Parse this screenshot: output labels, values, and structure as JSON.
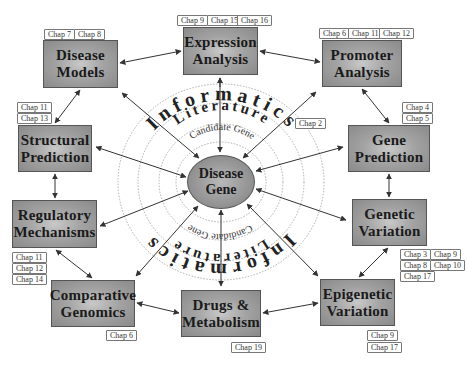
{
  "center": {
    "line1": "Disease",
    "line2": "Gene"
  },
  "rings": {
    "inner": "Candidate Gene",
    "middle": "Literature",
    "outer": "Informatics"
  },
  "nodes": [
    {
      "id": "disease-models",
      "line1": "Disease",
      "line2": "Models",
      "chapters": [
        "Chap 7",
        "Chap 8"
      ]
    },
    {
      "id": "expression-analysis",
      "line1": "Expression",
      "line2": "Analysis",
      "chapters": [
        "Chap 9",
        "Chap 15",
        "Chap 16"
      ]
    },
    {
      "id": "promoter-analysis",
      "line1": "Promoter",
      "line2": "Analysis",
      "chapters": [
        "Chap 6",
        "Chap 11",
        "Chap 12"
      ]
    },
    {
      "id": "structural-prediction",
      "line1": "Structural",
      "line2": "Prediction",
      "chapters": [
        "Chap 11",
        "Chap 13"
      ]
    },
    {
      "id": "gene-prediction",
      "line1": "Gene",
      "line2": "Prediction",
      "chapters": [
        "Chap 4",
        "Chap 5"
      ]
    },
    {
      "id": "regulatory-mechanisms",
      "line1": "Regulatory",
      "line2": "Mechanisms",
      "chapters": [
        "Chap 11",
        "Chap 12",
        "Chap 14"
      ]
    },
    {
      "id": "genetic-variation",
      "line1": "Genetic",
      "line2": "Variation",
      "chapters": [
        "Chap 3",
        "Chap 9",
        "Chap 8",
        "Chap 10",
        "Chap 17"
      ]
    },
    {
      "id": "comparative-genomics",
      "line1": "Comparative",
      "line2": "Genomics",
      "chapters": [
        "Chap 6"
      ]
    },
    {
      "id": "drugs-metabolism",
      "line1": "Drugs &",
      "line2": "Metabolism",
      "chapters": [
        "Chap 19"
      ]
    },
    {
      "id": "epigenetic-variation",
      "line1": "Epigenetic",
      "line2": "Variation",
      "chapters": [
        "Chap 9",
        "Chap 17"
      ]
    }
  ],
  "informatics_chapter": "Chap 2",
  "colors": {
    "box_fill": "#a3a3a3",
    "box_border": "#555555",
    "ring_stroke": "#999999",
    "arrow": "#333333",
    "text": "#1a1a1a"
  }
}
